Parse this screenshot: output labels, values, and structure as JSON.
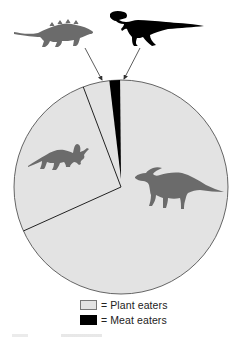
{
  "chart_data": {
    "type": "pie",
    "title": "",
    "slices": [
      {
        "label": "Meat eaters",
        "value": 1,
        "color": "#000000",
        "group": "meat",
        "icon": "tyrannosaurus-silhouette-icon"
      },
      {
        "label": "Plant eaters (armored)",
        "value": 4,
        "color": "#e3e3e3",
        "group": "plant",
        "icon": "ankylosaur-silhouette-icon"
      },
      {
        "label": "Plant eaters (horned)",
        "value": 26,
        "color": "#e3e3e3",
        "group": "plant",
        "icon": "triceratops-silhouette-icon"
      },
      {
        "label": "Plant eaters (duck-billed)",
        "value": 69,
        "color": "#e3e3e3",
        "group": "plant",
        "icon": "parasaurolophus-silhouette-icon"
      }
    ],
    "legend": [
      {
        "swatch": "#e3e3e3",
        "label": "= Plant eaters"
      },
      {
        "swatch": "#000000",
        "label": "= Meat eaters"
      }
    ],
    "legend_position": "bottom-center",
    "units": "approximate percent of pie"
  },
  "colors": {
    "plant": "#e3e3e3",
    "meat": "#000000",
    "silhouette_gray": "#6b6b6b",
    "outline": "#555555"
  },
  "legend": {
    "plant_label": "= Plant eaters",
    "meat_label": "= Meat eaters"
  }
}
